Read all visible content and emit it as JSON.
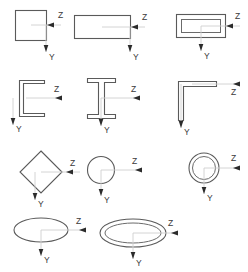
{
  "diagram": {
    "axis_labels": {
      "horizontal": "Z",
      "vertical": "Y"
    },
    "colors": {
      "outline": "#5a5a5a",
      "guide_line": "#cfcfcf",
      "arrow": "#2b2b2b",
      "label_text": "#3a3a3a",
      "background": "#ffffff"
    },
    "rows": [
      {
        "row": 1,
        "shapes": [
          {
            "id": "square",
            "name": "Solid square section",
            "z_label": "Z",
            "y_label": "Y",
            "z_arrow_direction": "left",
            "y_arrow_direction": "down"
          },
          {
            "id": "rectangle",
            "name": "Solid rectangle section",
            "z_label": "Z",
            "y_label": "Y",
            "z_arrow_direction": "left",
            "y_arrow_direction": "down"
          },
          {
            "id": "rectangular-tube",
            "name": "Hollow rectangular tube section",
            "z_label": "Z",
            "y_label": "Y",
            "z_arrow_direction": "left",
            "y_arrow_direction": "down"
          }
        ]
      },
      {
        "row": 2,
        "shapes": [
          {
            "id": "channel",
            "name": "C-channel section",
            "z_label": "Z",
            "y_label": "Y",
            "z_arrow_direction": "right",
            "y_arrow_direction": "down"
          },
          {
            "id": "i-beam",
            "name": "I-beam section",
            "z_label": "Z",
            "y_label": "Y",
            "z_arrow_direction": "right",
            "y_arrow_direction": "down"
          },
          {
            "id": "angle",
            "name": "L-angle section",
            "z_label": "Z",
            "y_label": "Y",
            "z_arrow_direction": "right",
            "y_arrow_direction": "down"
          }
        ]
      },
      {
        "row": 3,
        "shapes": [
          {
            "id": "diamond",
            "name": "Rotated square (diamond) section",
            "z_label": "Z",
            "y_label": "Y",
            "z_arrow_direction": "left",
            "y_arrow_direction": "down"
          },
          {
            "id": "circle",
            "name": "Solid circular section",
            "z_label": "Z",
            "y_label": "Y",
            "z_arrow_direction": "right",
            "y_arrow_direction": "down"
          },
          {
            "id": "circular-tube",
            "name": "Hollow circular tube section",
            "z_label": "Z",
            "y_label": "Y",
            "z_arrow_direction": "right",
            "y_arrow_direction": "down"
          }
        ]
      },
      {
        "row": 4,
        "shapes": [
          {
            "id": "ellipse",
            "name": "Solid elliptical section",
            "z_label": "Z",
            "y_label": "Y",
            "z_arrow_direction": "right",
            "y_arrow_direction": "down"
          },
          {
            "id": "elliptical-tube",
            "name": "Hollow elliptical tube section",
            "z_label": "Z",
            "y_label": "Y",
            "z_arrow_direction": "right",
            "y_arrow_direction": "down"
          }
        ]
      }
    ]
  }
}
